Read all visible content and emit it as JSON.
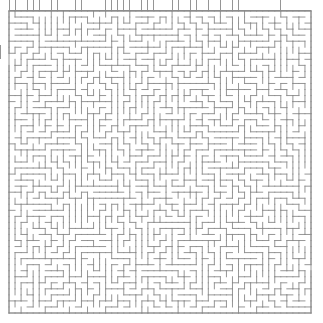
{
  "figure": {
    "kind": "maze-puzzle",
    "title": "Maze",
    "width_px": 323,
    "height_px": 323,
    "background_color": "#ffffff"
  },
  "maze": {
    "name": "perfect-maze",
    "algorithm": "randomized-depth-first-search",
    "seed": 20240617,
    "columns": 50,
    "rows": 50,
    "cell_size_px": 6.04,
    "origin_x_px": 9,
    "origin_y_px": 11,
    "wall_color": "#8a8a8a",
    "wall_width_px": 0.9,
    "passage_color": "#ffffff",
    "border": {
      "top": true,
      "right": true,
      "bottom": true,
      "left": true
    },
    "entrance": {
      "name": "left-entrance-gap",
      "side": "left",
      "cell_row": 7,
      "gap_cells": 2
    },
    "exit": {
      "name": "right-exit-gap",
      "side": "right",
      "cell_row": 42,
      "gap_cells": 1
    }
  },
  "top_strip": {
    "name": "clipped-maze-row",
    "description": "partial maze row clipped by the top image edge",
    "baseline_y_px": 10,
    "start_x_px": 9,
    "end_x_px": 311,
    "tick_height_px": 10,
    "tick_color": "#8a8a8a",
    "seed": 917,
    "tick_probability": 0.42
  },
  "left_notch": {
    "name": "left-edge-notch",
    "x_px": 0,
    "y_px": 45,
    "height_px": 14,
    "color": "#8a8a8a"
  }
}
